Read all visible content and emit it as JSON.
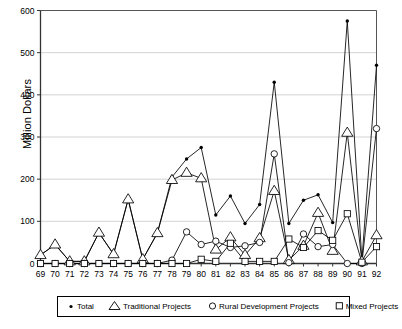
{
  "chart_data": {
    "type": "line",
    "title": "",
    "xlabel": "",
    "ylabel": "Million Dollars",
    "xlim": [
      69,
      92
    ],
    "ylim": [
      0,
      600
    ],
    "ytick_values": [
      0,
      100,
      200,
      300,
      400,
      500,
      600
    ],
    "ytick_labels": [
      "0",
      "100",
      "200",
      "300",
      "400",
      "500",
      "600"
    ],
    "grid": true,
    "legend_position": "bottom",
    "categories": [
      "69",
      "70",
      "71",
      "72",
      "73",
      "74",
      "75",
      "76",
      "77",
      "78",
      "79",
      "80",
      "81",
      "82",
      "83",
      "84",
      "85",
      "86",
      "87",
      "88",
      "89",
      "90",
      "91",
      "92"
    ],
    "series": [
      {
        "name": "Total",
        "marker": "dot",
        "values": [
          20,
          45,
          5,
          5,
          73,
          22,
          152,
          10,
          72,
          205,
          248,
          275,
          115,
          160,
          95,
          140,
          430,
          95,
          150,
          163,
          97,
          575,
          8,
          470
        ]
      },
      {
        "name": "Traditional Projects",
        "marker": "triangle",
        "values": [
          20,
          45,
          5,
          5,
          73,
          22,
          152,
          10,
          72,
          198,
          215,
          202,
          33,
          62,
          20,
          60,
          172,
          8,
          42,
          120,
          30,
          310,
          5,
          67
        ]
      },
      {
        "name": "Rural Development Projects",
        "marker": "circle",
        "values": [
          0,
          0,
          0,
          0,
          0,
          0,
          0,
          0,
          0,
          8,
          75,
          45,
          53,
          38,
          42,
          50,
          260,
          2,
          70,
          40,
          45,
          0,
          0,
          320
        ]
      },
      {
        "name": "Mixed Projects",
        "marker": "square",
        "values": [
          0,
          0,
          0,
          0,
          0,
          0,
          0,
          0,
          0,
          0,
          0,
          10,
          5,
          48,
          5,
          5,
          5,
          58,
          38,
          78,
          55,
          118,
          3,
          40
        ]
      }
    ]
  },
  "legend": {
    "items": [
      {
        "label": "Total",
        "marker": "dot-marker"
      },
      {
        "label": "Traditional Projects",
        "marker": "triangle-marker"
      },
      {
        "label": "Rural Development Projects",
        "marker": "circle-marker"
      },
      {
        "label": "Mixed Projects",
        "marker": "square-marker"
      }
    ]
  },
  "colors": {
    "line": "#000000",
    "grid": "#c8c8c8",
    "axis": "#555555",
    "background": "#ffffff"
  }
}
